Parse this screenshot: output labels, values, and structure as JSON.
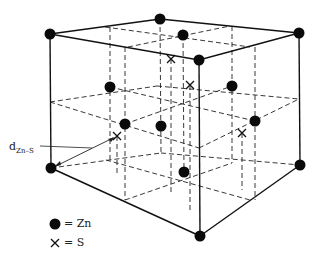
{
  "figure": {
    "bond_label": {
      "main": "d",
      "subscript": "Zn–S"
    },
    "legend": [
      {
        "symbol": "filled-circle",
        "text": "= Zn"
      },
      {
        "symbol": "cross",
        "text": "= S"
      }
    ],
    "colors": {
      "line": "#111111",
      "atom": "#0a0a0a",
      "background": "#ffffff"
    }
  }
}
